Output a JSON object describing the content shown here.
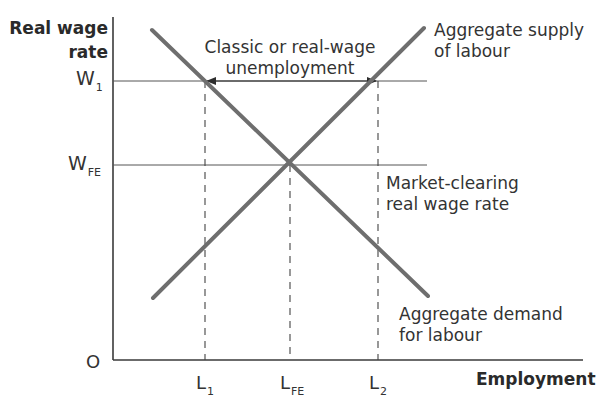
{
  "diagram": {
    "type": "labour-market supply-demand diagram",
    "y_axis": {
      "label_line1": "Real wage",
      "label_line2": "rate"
    },
    "x_axis": {
      "label": "Employment"
    },
    "origin_label": "O",
    "y_ticks": [
      {
        "main": "W",
        "sub": "1"
      },
      {
        "main": "W",
        "sub": "FE"
      }
    ],
    "x_ticks": [
      {
        "main": "L",
        "sub": "1"
      },
      {
        "main": "L",
        "sub": "FE"
      },
      {
        "main": "L",
        "sub": "2"
      }
    ],
    "annotations": {
      "unemployment_line1": "Classic or real-wage",
      "unemployment_line2": "unemployment",
      "supply_line1": "Aggregate supply",
      "supply_line2": "of labour",
      "market_clearing_line1": "Market-clearing",
      "market_clearing_line2": "real wage rate",
      "demand_line1": "Aggregate demand",
      "demand_line2": "for labour"
    },
    "curves": [
      {
        "name": "Aggregate supply of labour",
        "slope": "upward"
      },
      {
        "name": "Aggregate demand for labour",
        "slope": "downward"
      }
    ],
    "colors": {
      "curve": "#6e6e6e",
      "axis": "#3a3a3a",
      "guide": "#555555",
      "text": "#333333"
    }
  }
}
